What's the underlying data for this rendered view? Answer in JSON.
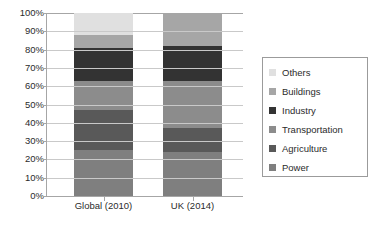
{
  "chart_data": {
    "type": "bar",
    "subtype": "stacked-100-percent",
    "title": "",
    "xlabel": "",
    "ylabel": "",
    "ylim": [
      0,
      100
    ],
    "y_tick_labels": [
      "100%",
      "90%",
      "80%",
      "70%",
      "60%",
      "50%",
      "40%",
      "30%",
      "20%",
      "10%",
      "0%"
    ],
    "y_tick_values": [
      100,
      90,
      80,
      70,
      60,
      50,
      40,
      30,
      20,
      10,
      0
    ],
    "grid": true,
    "legend_position": "right",
    "categories": [
      "Global (2010)",
      "UK (2014)"
    ],
    "series": [
      {
        "name": "Power",
        "color": "#7f7f7f",
        "values": [
          25,
          24
        ]
      },
      {
        "name": "Agriculture",
        "color": "#595959",
        "values": [
          22,
          13
        ]
      },
      {
        "name": "Transportation",
        "color": "#8c8c8c",
        "values": [
          16,
          26
        ]
      },
      {
        "name": "Industry",
        "color": "#333333",
        "values": [
          18,
          19
        ]
      },
      {
        "name": "Buildings",
        "color": "#a6a6a6",
        "values": [
          7,
          18
        ]
      },
      {
        "name": "Others",
        "color": "#e0e0e0",
        "values": [
          12,
          0
        ]
      }
    ],
    "legend_entries": [
      {
        "label": "Others",
        "color": "#e0e0e0"
      },
      {
        "label": "Buildings",
        "color": "#a6a6a6"
      },
      {
        "label": "Industry",
        "color": "#333333"
      },
      {
        "label": "Transportation",
        "color": "#8c8c8c"
      },
      {
        "label": "Agriculture",
        "color": "#595959"
      },
      {
        "label": "Power",
        "color": "#7f7f7f"
      }
    ]
  }
}
